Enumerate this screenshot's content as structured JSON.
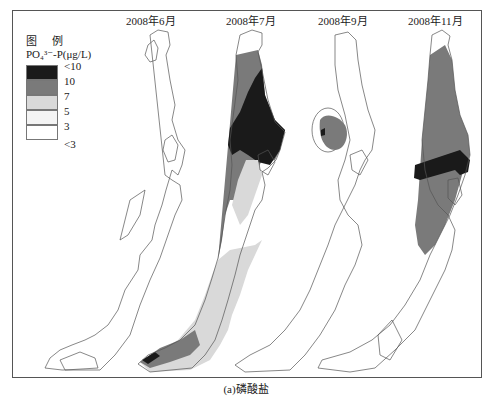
{
  "figure": {
    "caption": "(a)磷酸盐",
    "panels": [
      {
        "title": "2008年6月",
        "x": 148
      },
      {
        "title": "2008年7月",
        "x": 252
      },
      {
        "title": "2008年9月",
        "x": 342
      },
      {
        "title": "2008年11月",
        "x": 424
      }
    ],
    "legend": {
      "heading": "图 例",
      "variable": "PO₄³⁻-P(μg/L)",
      "items": [
        {
          "label": "<10",
          "color": "#1a1a1a"
        },
        {
          "label": "10",
          "color": "#7a7a7a"
        },
        {
          "label": "7",
          "color": "#d9d9d9"
        },
        {
          "label": "5",
          "color": "#f4f4f4"
        },
        {
          "label": "3",
          "color": "#ffffff"
        },
        {
          "label": "<3",
          "color": null
        }
      ]
    },
    "colors": {
      "class_gt10": "#1a1a1a",
      "class_10": "#7a7a7a",
      "class_7": "#d9d9d9",
      "class_5": "#f4f4f4",
      "class_3": "#ffffff",
      "outline": "#555555"
    }
  }
}
